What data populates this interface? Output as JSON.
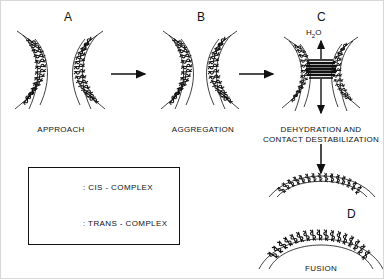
{
  "figure": {
    "background_color": "#ffffff",
    "ink_color": "#111111"
  },
  "panels": [
    {
      "letter": "A",
      "caption": "APPROACH",
      "description": "Two curved lipid bilayer membranes approaching each other"
    },
    {
      "letter": "B",
      "caption": "AGGREGATION",
      "description": "Membranes in close apposition, aggregated"
    },
    {
      "letter": "C",
      "caption": "DEHYDRATION AND\nCONTACT DESTABILIZATION",
      "annotation": "H2O",
      "annotation_sub": "2",
      "annotation_pre": "H",
      "annotation_post": "O",
      "description": "Water expelled from contact zone, bilayers destabilize"
    },
    {
      "letter": "D",
      "caption": "FUSION",
      "description": "Single continuous fused bilayer membrane"
    }
  ],
  "legend": {
    "items": [
      {
        "symbol": "cis-complex-glyph",
        "label": ": CIS - COMPLEX"
      },
      {
        "symbol": "trans-complex-glyph",
        "label": ": TRANS - COMPLEX"
      }
    ]
  },
  "arrows": [
    {
      "name": "arrow-a-to-b",
      "direction": "right"
    },
    {
      "name": "arrow-b-to-c",
      "direction": "right"
    },
    {
      "name": "arrow-water-up",
      "direction": "up"
    },
    {
      "name": "arrow-water-down",
      "direction": "down"
    },
    {
      "name": "arrow-c-to-d",
      "direction": "down"
    }
  ]
}
